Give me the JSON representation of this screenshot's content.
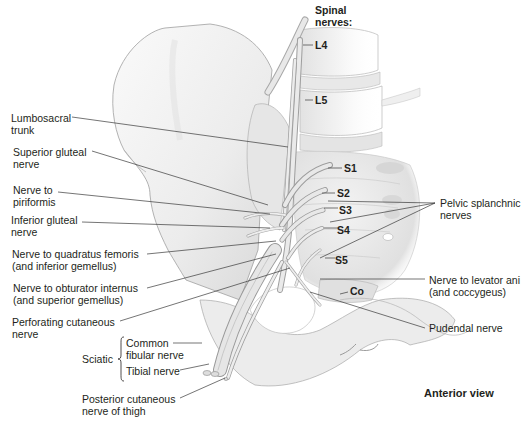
{
  "figure": {
    "view_label": "Anterior view",
    "spinal_nerves_heading": [
      "Spinal",
      "nerves:"
    ],
    "segments": [
      "L4",
      "L5",
      "S1",
      "S2",
      "S3",
      "S4",
      "S5",
      "Co"
    ]
  },
  "left_labels": [
    {
      "id": "lumbosacral-trunk",
      "lines": [
        "Lumbosacral",
        "trunk"
      ]
    },
    {
      "id": "superior-gluteal-nerve",
      "lines": [
        "Superior gluteal",
        "nerve"
      ]
    },
    {
      "id": "nerve-to-piriformis",
      "lines": [
        "Nerve to",
        "piriformis"
      ]
    },
    {
      "id": "inferior-gluteal-nerve",
      "lines": [
        "Inferior gluteal",
        "nerve"
      ]
    },
    {
      "id": "nerve-to-quadratus-femoris",
      "lines": [
        "Nerve to quadratus femoris",
        "(and inferior gemellus)"
      ]
    },
    {
      "id": "nerve-to-obturator-internus",
      "lines": [
        "Nerve to obturator internus",
        "(and superior gemellus)"
      ]
    },
    {
      "id": "perforating-cutaneous-nerve",
      "lines": [
        "Perforating cutaneous",
        "nerve"
      ]
    },
    {
      "id": "posterior-cutaneous-nerve-of-thigh",
      "lines": [
        "Posterior cutaneous",
        "nerve of thigh"
      ]
    }
  ],
  "sciatic": {
    "label": "Sciatic",
    "branches": [
      {
        "id": "common-fibular-nerve",
        "lines": [
          "Common",
          "fibular nerve"
        ]
      },
      {
        "id": "tibial-nerve",
        "lines": [
          "Tibial nerve"
        ]
      }
    ]
  },
  "right_labels": [
    {
      "id": "pelvic-splanchnic-nerves",
      "lines": [
        "Pelvic splanchnic",
        "nerves"
      ]
    },
    {
      "id": "nerve-to-levator-ani",
      "lines": [
        "Nerve to levator ani",
        "(and coccygeus)"
      ]
    },
    {
      "id": "pudendal-nerve",
      "lines": [
        "Pudendal nerve"
      ]
    }
  ],
  "colors": {
    "bone_fill": "#efefef",
    "bone_shade": "#d9d9d9",
    "outline": "#9a9a9a",
    "nerve": "#e4e4e4",
    "leader": "#3a3a3a",
    "text": "#231f20"
  }
}
